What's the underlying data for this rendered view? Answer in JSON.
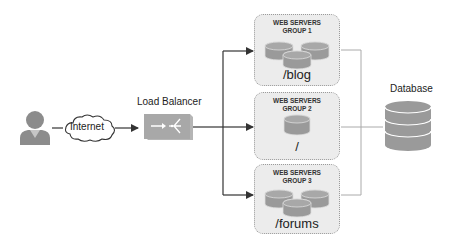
{
  "diagram": {
    "client": {
      "label": "user",
      "icon": "user-icon"
    },
    "internet": {
      "label": "Internet",
      "icon": "cloud-icon"
    },
    "load_balancer": {
      "label": "Load Balancer",
      "icon": "load-balancer-icon"
    },
    "groups": [
      {
        "title_line1": "WEB SERVERS",
        "title_line2": "GROUP 1",
        "path": "/blog",
        "servers": 3,
        "server_label": "www"
      },
      {
        "title_line1": "WEB SERVERS",
        "title_line2": "GROUP 2",
        "path": "/",
        "servers": 1,
        "server_label": "www"
      },
      {
        "title_line1": "WEB SERVERS",
        "title_line2": "GROUP 3",
        "path": "/forums",
        "servers": 3,
        "server_label": "www"
      }
    ],
    "database": {
      "label": "Database",
      "icon": "database-icon"
    },
    "colors": {
      "icon_gray": "#8c8c8c",
      "group_fill": "#ececec",
      "group_border": "#9a9a9a",
      "arrow": "#333333",
      "db_line": "#aaaaaa"
    }
  }
}
